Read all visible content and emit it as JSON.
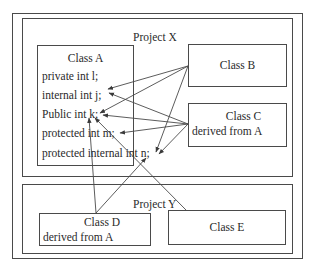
{
  "diagram": {
    "outer_frame": {},
    "project_x": {
      "title": "Project X",
      "class_a": {
        "title": "Class A",
        "members": [
          "private int l;",
          "internal int j;",
          "Public int k;",
          "protected int m;",
          "protected internal int n;"
        ]
      },
      "class_b": {
        "title": "Class B"
      },
      "class_c": {
        "title": "Class C",
        "subtitle": "derived from A"
      }
    },
    "project_y": {
      "title": "Project Y",
      "class_d": {
        "title": "Class D",
        "subtitle": "derived from A"
      },
      "class_e": {
        "title": "Class E"
      }
    },
    "access_arrows": [
      {
        "from": "Class B",
        "to": "internal int j;"
      },
      {
        "from": "Class B",
        "to": "Public int k;"
      },
      {
        "from": "Class B",
        "to": "protected internal int n;"
      },
      {
        "from": "Class C",
        "to": "internal int j;"
      },
      {
        "from": "Class C",
        "to": "Public int k;"
      },
      {
        "from": "Class C",
        "to": "protected int m;"
      },
      {
        "from": "Class C",
        "to": "protected internal int n;"
      },
      {
        "from": "Class D",
        "to": "Public int k;"
      },
      {
        "from": "Class D",
        "to": "protected internal int n;"
      },
      {
        "from": "Class E",
        "to": "Public int k;"
      }
    ],
    "colors": {
      "line": "#4a4a4a",
      "text": "#2a2a2a",
      "background": "#ffffff"
    }
  }
}
